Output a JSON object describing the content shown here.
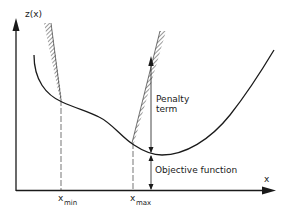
{
  "diagram": {
    "axes": {
      "y_label": "z(x)",
      "x_label": "x"
    },
    "markers": {
      "x_min": {
        "base": "x",
        "subscript": "min"
      },
      "x_max": {
        "base": "x",
        "subscript": "max"
      }
    },
    "annotations": {
      "penalty_line1": "Penalty",
      "penalty_line2": "term",
      "objective": "Objective function"
    },
    "colors": {
      "ink": "#1a1a1a",
      "background": "#ffffff"
    }
  }
}
